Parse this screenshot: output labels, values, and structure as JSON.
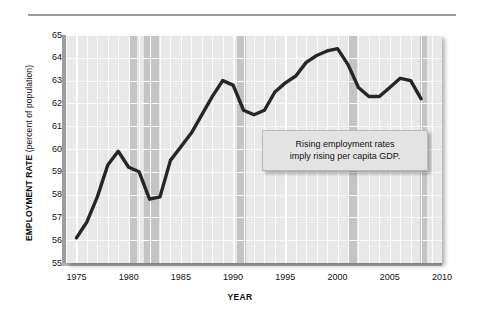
{
  "chart_data": {
    "type": "line",
    "title": "",
    "xlabel": "YEAR",
    "ylabel": "EMPLOYMENT RATE (percent of population)",
    "ylabel_bold_part": "EMPLOYMENT RATE",
    "ylabel_paren_part": "(percent of population)",
    "xlim": [
      1974,
      2010
    ],
    "ylim": [
      55,
      65
    ],
    "yticks": [
      65,
      64,
      63,
      62,
      61,
      60,
      59,
      58,
      57,
      56,
      55
    ],
    "xticks": [
      1975,
      1980,
      1985,
      1990,
      1995,
      2000,
      2005,
      2010
    ],
    "grid": true,
    "legend": "none",
    "series": [
      {
        "name": "Employment rate",
        "x": [
          1975,
          1976,
          1977,
          1978,
          1979,
          1980,
          1981,
          1982,
          1983,
          1984,
          1985,
          1986,
          1987,
          1988,
          1989,
          1990,
          1991,
          1992,
          1993,
          1994,
          1995,
          1996,
          1997,
          1998,
          1999,
          2000,
          2001,
          2002,
          2003,
          2004,
          2005,
          2006,
          2007,
          2008
        ],
        "values": [
          56.1,
          56.8,
          57.9,
          59.3,
          59.9,
          59.2,
          59.0,
          57.8,
          57.9,
          59.5,
          60.1,
          60.7,
          61.5,
          62.3,
          63.0,
          62.8,
          61.7,
          61.5,
          61.7,
          62.5,
          62.9,
          63.2,
          63.8,
          64.1,
          64.3,
          64.4,
          63.7,
          62.7,
          62.3,
          62.3,
          62.7,
          63.1,
          63.0,
          62.2
        ],
        "color": "#262626",
        "line_width": 3.4
      }
    ],
    "shaded_bands": [
      {
        "label": "recession",
        "start": 1980.0,
        "end": 1980.8,
        "color": "#c4c4c4"
      },
      {
        "label": "recession",
        "start": 1981.5,
        "end": 1982.9,
        "color": "#c4c4c4"
      },
      {
        "label": "recession",
        "start": 1990.4,
        "end": 1991.2,
        "color": "#c4c4c4"
      },
      {
        "label": "recession",
        "start": 2001.1,
        "end": 2001.9,
        "color": "#c4c4c4"
      },
      {
        "label": "recession",
        "start": 2007.9,
        "end": 2008.6,
        "color": "#c4c4c4"
      }
    ],
    "annotations": [
      {
        "name": "callout",
        "line1": "Rising employment rates",
        "line2": "imply rising per capita GDP.",
        "x": 1999.5,
        "y": 60.3
      }
    ],
    "plot_bg": "#e8e8e8",
    "grid_color": "#ffffff"
  }
}
